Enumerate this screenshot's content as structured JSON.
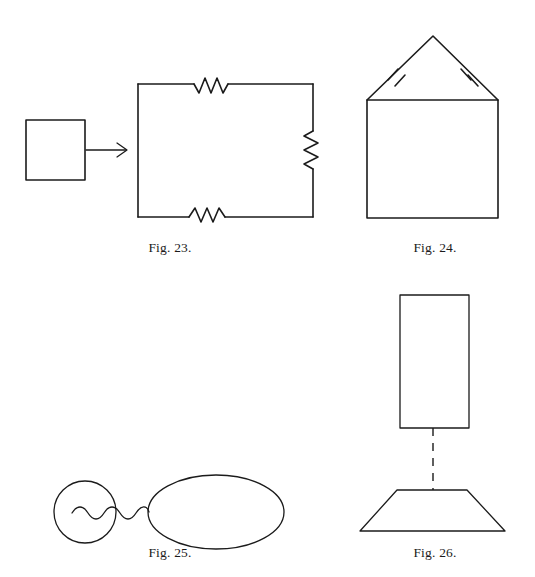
{
  "page": {
    "background_color": "#ffffff",
    "ink_color": "#1b1b1b",
    "width": 535,
    "height": 577
  },
  "figures": [
    {
      "id": "fig-23",
      "caption": "Fig. 23.",
      "description": "Small square with arrow pointing right to a large rectangle whose top, right and bottom sides each contain a zigzag segment",
      "parts": [
        {
          "name": "small-square",
          "shape": "square"
        },
        {
          "name": "arrow",
          "shape": "arrow-right"
        },
        {
          "name": "large-rectangle",
          "shape": "rectangle"
        },
        {
          "name": "zigzag-top",
          "shape": "zigzag"
        },
        {
          "name": "zigzag-right",
          "shape": "zigzag"
        },
        {
          "name": "zigzag-bottom",
          "shape": "zigzag"
        }
      ]
    },
    {
      "id": "fig-24",
      "caption": "Fig. 24.",
      "description": "House outline: a square surmounted by an isosceles triangle roof; each roof slope carries a double tick congruence mark",
      "parts": [
        {
          "name": "house-square",
          "shape": "square"
        },
        {
          "name": "roof-triangle",
          "shape": "triangle"
        },
        {
          "name": "tick-mark-left",
          "shape": "double-tick"
        },
        {
          "name": "tick-mark-right",
          "shape": "double-tick"
        }
      ]
    },
    {
      "id": "fig-25",
      "caption": "Fig. 25.",
      "description": "Small circle joined to a large ellipse by a wavy line that begins inside the circle",
      "parts": [
        {
          "name": "small-circle",
          "shape": "circle"
        },
        {
          "name": "large-ellipse",
          "shape": "ellipse"
        },
        {
          "name": "wavy-connector",
          "shape": "wave"
        }
      ]
    },
    {
      "id": "fig-26",
      "caption": "Fig. 26.",
      "description": "Tall rectangle above a trapezoid, joined by a vertical dashed line",
      "parts": [
        {
          "name": "upper-rectangle",
          "shape": "rectangle"
        },
        {
          "name": "dashed-connector",
          "shape": "dashed-line"
        },
        {
          "name": "lower-trapezoid",
          "shape": "trapezoid"
        }
      ]
    }
  ]
}
